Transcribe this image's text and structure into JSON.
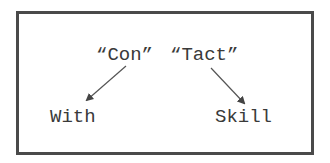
{
  "diagram": {
    "top_words": [
      {
        "text": "“Con”"
      },
      {
        "text": "“Tact”"
      }
    ],
    "bottom_words": [
      {
        "text": "With"
      },
      {
        "text": "Skill"
      }
    ],
    "arrows": [
      {
        "from": "“Con”",
        "to": "With"
      },
      {
        "from": "“Tact”",
        "to": "Skill"
      }
    ],
    "colors": {
      "border": "#4a4a4a",
      "text": "#3a3a3a",
      "arrow": "#555555"
    }
  }
}
